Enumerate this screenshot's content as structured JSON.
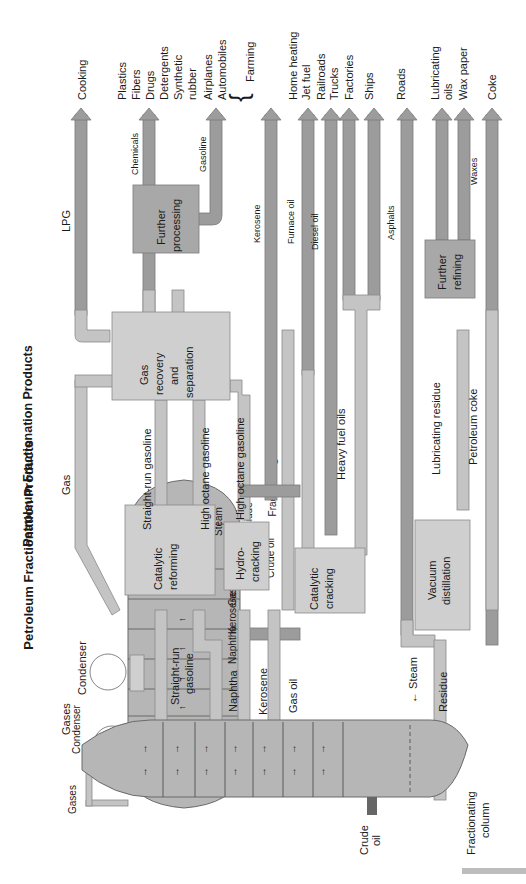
{
  "title": "Petroleum Fractionation Products",
  "column": {
    "label": "Fractionating column",
    "input": "Crude oil",
    "steam": "Steam",
    "condenser": "Condenser",
    "gases": "Gases"
  },
  "fractions": [
    "Straight-run gasoline",
    "Naphtha",
    "Kerosene",
    "Gas oil",
    "Residue"
  ],
  "processes": {
    "catalytic_reforming": "Catalytic reforming",
    "hydrocracking": "Hydro-cracking",
    "catalytic_cracking": "Catalytic cracking",
    "vacuum_distillation": "Vacuum distillation",
    "gas_recovery": "Gas recovery and separation",
    "further_processing": "Further processing",
    "further_refining": "Further refining"
  },
  "streams": {
    "gas": "Gas",
    "straight_run_gasoline": "Straight-run gasoline",
    "high_octane_gasoline_1": "High octane gasoline",
    "high_octane_gasoline_2": "High octane gasoline",
    "heavy_fuel_oils": "Heavy fuel oils",
    "lubricating_residue": "Lubricating residue",
    "petroleum_coke": "Petroleum coke",
    "lpg": "LPG",
    "chemicals": "Chemicals",
    "gasoline": "Gasoline",
    "kerosene": "Kerosene",
    "furnace_oil": "Furnace oil",
    "diesel_oil": "Diesel oil",
    "asphalts": "Asphalts",
    "waxes": "Waxes"
  },
  "end_uses": {
    "cooking": "Cooking",
    "chemicals_uses": [
      "Plastics",
      "Fibers",
      "Drugs",
      "Detergents",
      "Synthetic",
      "rubber"
    ],
    "gasoline_uses": [
      "Airplanes",
      "Automobiles"
    ],
    "farming": "Farming",
    "home_heating": "Home heating",
    "jet_fuel": "Jet fuel",
    "railroads": "Railroads",
    "trucks": "Trucks",
    "factories": "Factories",
    "ships": "Ships",
    "roads": "Roads",
    "lubricating_oils": [
      "Lubricating",
      "oils"
    ],
    "wax_paper": "Wax paper",
    "coke": "Coke"
  }
}
